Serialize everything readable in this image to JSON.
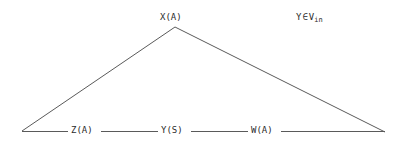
{
  "diagram": {
    "type": "triangle-graph",
    "background_color": "#ffffff",
    "line_color": "#5a5a5a",
    "text_color": "#2b2b2b",
    "vertices": [
      {
        "id": "apex",
        "label": "X(A)",
        "x": 175,
        "y": 27
      },
      {
        "id": "left",
        "label": "",
        "x": 22,
        "y": 131
      },
      {
        "id": "right",
        "label": "",
        "x": 385,
        "y": 132
      }
    ],
    "apex_label": "X(A)",
    "base_labels": [
      {
        "id": "z",
        "label": "Z(A)"
      },
      {
        "id": "y",
        "label": "Y(S)"
      },
      {
        "id": "w",
        "label": "W(A)"
      }
    ],
    "base_segments": [
      {
        "from_x": 22,
        "to_x": 68
      },
      {
        "from_x": 101,
        "to_x": 158
      },
      {
        "from_x": 191,
        "to_x": 248
      },
      {
        "from_x": 281,
        "to_x": 385
      }
    ],
    "annotation": {
      "variable": "Y",
      "relation": "∈",
      "set_base": "V",
      "set_subscript": "in",
      "full_text": "Y ∈ V_in"
    }
  }
}
